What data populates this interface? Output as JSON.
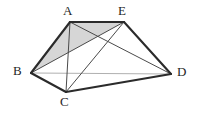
{
  "figure": {
    "background_color": "#ffffff",
    "stroke_color": "#2b2b2b",
    "thin_stroke_color": "#4a4a4a",
    "hidden_stroke_color": "#b0b0b0",
    "shade_fill_color": "#c8c8c8",
    "shade_opacity": "0.75",
    "vertices": [
      {
        "id": "A",
        "label": "A",
        "x": 70,
        "y": 22,
        "label_x": 63,
        "label_y": 4
      },
      {
        "id": "E",
        "label": "E",
        "x": 124,
        "y": 22,
        "label_x": 118,
        "label_y": 4
      },
      {
        "id": "B",
        "label": "B",
        "x": 31,
        "y": 73,
        "label_x": 13,
        "label_y": 64
      },
      {
        "id": "D",
        "label": "D",
        "x": 171,
        "y": 74,
        "label_x": 177,
        "label_y": 65
      },
      {
        "id": "C",
        "label": "C",
        "x": 66,
        "y": 92,
        "label_x": 60,
        "label_y": 95
      }
    ],
    "edges_thick": [
      {
        "name": "edge-B-A",
        "from": "B",
        "to": "A"
      },
      {
        "name": "edge-A-E",
        "from": "A",
        "to": "E"
      },
      {
        "name": "edge-E-D",
        "from": "E",
        "to": "D"
      },
      {
        "name": "edge-B-C",
        "from": "B",
        "to": "C"
      },
      {
        "name": "edge-C-D",
        "from": "C",
        "to": "D"
      }
    ],
    "edges_thin": [
      {
        "name": "edge-A-C",
        "from": "A",
        "to": "C"
      },
      {
        "name": "edge-A-D",
        "from": "A",
        "to": "D"
      },
      {
        "name": "edge-E-C",
        "from": "E",
        "to": "C"
      },
      {
        "name": "edge-E-B",
        "from": "E",
        "to": "B"
      }
    ],
    "edges_hidden": [
      {
        "name": "edge-B-D",
        "from": "B",
        "to": "D"
      }
    ],
    "shaded_faces": [
      {
        "name": "face-B-A-E",
        "polygon": "B,A,E"
      }
    ]
  }
}
